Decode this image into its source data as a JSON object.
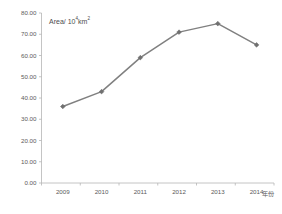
{
  "chart_data": {
    "type": "line",
    "title": "",
    "subtitle": "",
    "xlabel": "2014年份",
    "ylabel": "Area/ 10⁴km²",
    "ylabel_base": "Area/ 10",
    "ylabel_exp": "4",
    "ylabel_unit": "km",
    "ylabel_unit_exp": "2",
    "xaxis_title": "年份",
    "categories": [
      "2009",
      "2010",
      "2011",
      "2012",
      "2013",
      "2014"
    ],
    "values": [
      36.0,
      43.0,
      59.0,
      71.0,
      75.0,
      65.0
    ],
    "series": [
      {
        "name": "Area",
        "values": [
          36.0,
          43.0,
          59.0,
          71.0,
          75.0,
          65.0
        ]
      }
    ],
    "ylim": [
      0,
      80
    ],
    "ytick_step": 10,
    "ytick_labels": [
      "0.00",
      "10.00",
      "20.00",
      "30.00",
      "40.00",
      "50.00",
      "60.00",
      "70.00",
      "80.00"
    ],
    "ytick_values": [
      0,
      10,
      20,
      30,
      40,
      50,
      60,
      70,
      80
    ],
    "xtick_labels": [
      "2009",
      "2010",
      "2011",
      "2012",
      "2013",
      "2014"
    ],
    "grid": false,
    "legend": false,
    "legend_position": "none",
    "marker": "diamond",
    "colors": {
      "line": "#808080",
      "marker": "#707070",
      "axis": "#b5b5b5",
      "tick_text": "#5a5a5a",
      "annotation_text": "#4d4d4d",
      "background": "#ffffff"
    }
  }
}
